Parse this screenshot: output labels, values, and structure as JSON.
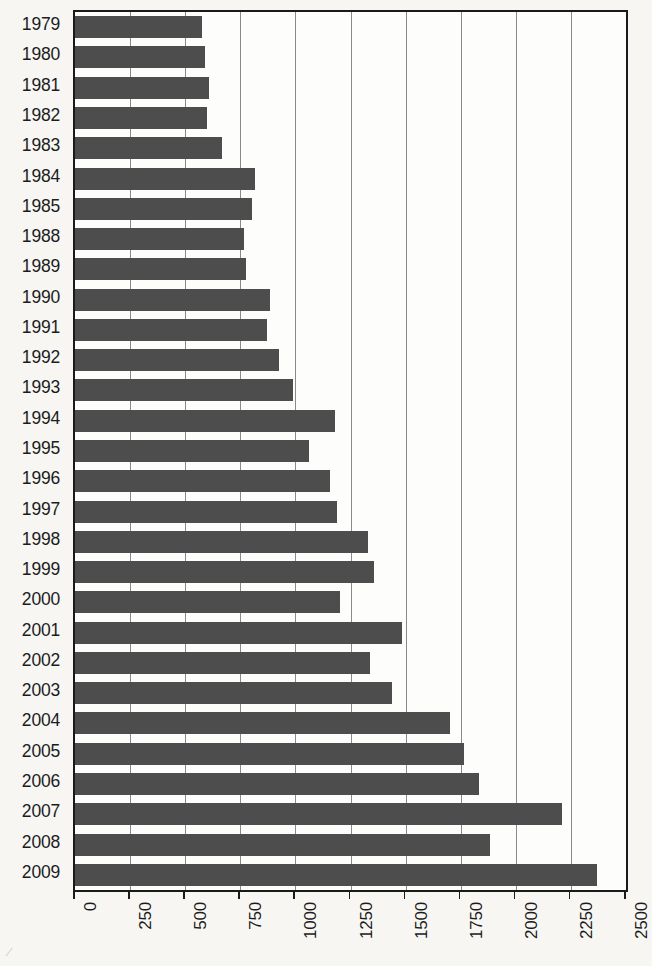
{
  "chart_data": {
    "type": "bar",
    "orientation": "horizontal",
    "title": "",
    "subtitle": "",
    "xlabel": "",
    "ylabel": "",
    "xlim": [
      0,
      2500
    ],
    "xticks": [
      0,
      250,
      500,
      750,
      1000,
      1250,
      1500,
      1750,
      2000,
      2250,
      2500
    ],
    "xtick_labels": [
      "0",
      "250",
      "500",
      "750",
      "1000",
      "1250",
      "1500",
      "1750",
      "2000",
      "2250",
      "2500"
    ],
    "xtick_label_rotation": 90,
    "grid": "vertical",
    "legend": null,
    "bar_color": "#4d4d4d",
    "background_color": "#f7f6f3",
    "plot_background_color": "#fdfdfb",
    "axis_color": "#1a1a1a",
    "gridline_color": "#8a8a8a",
    "categories": [
      "1979",
      "1980",
      "1981",
      "1982",
      "1983",
      "1984",
      "1985",
      "1988",
      "1989",
      "1990",
      "1991",
      "1992",
      "1993",
      "1994",
      "1995",
      "1996",
      "1997",
      "1998",
      "1999",
      "2000",
      "2001",
      "2002",
      "2003",
      "2004",
      "2005",
      "2006",
      "2007",
      "2008",
      "2009"
    ],
    "values": [
      575,
      590,
      608,
      600,
      667,
      818,
      803,
      767,
      776,
      885,
      871,
      926,
      989,
      1180,
      1062,
      1157,
      1189,
      1330,
      1357,
      1203,
      1484,
      1339,
      1439,
      1702,
      1766,
      1834,
      2210,
      1884,
      2368
    ]
  },
  "artifacts": {
    "corner_smudge": "⁄"
  }
}
